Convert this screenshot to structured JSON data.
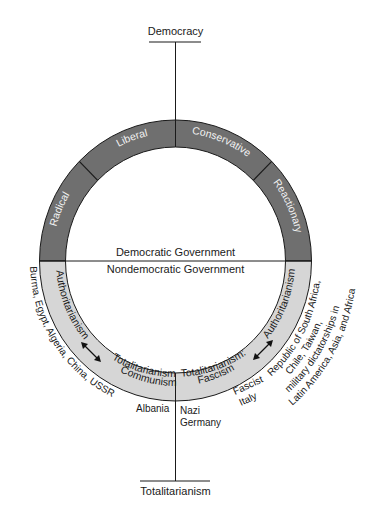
{
  "diagram": {
    "top_pole": "Democracy",
    "bottom_pole": "Totalitarianism",
    "divider": {
      "upper": "Democratic Government",
      "lower": "Nondemocratic Government"
    },
    "upper_ring": {
      "color": "#6f6f6f",
      "segments": [
        "Radical",
        "Liberal",
        "Conservative",
        "Reactionary"
      ]
    },
    "lower_ring": {
      "color": "#d6d6d6",
      "left": {
        "authoritarianism": "Authoritarianism",
        "totalitarianism_line1": "Totalitarianism:",
        "totalitarianism_line2": "Communism",
        "examples": "Burma, Egypt, Algeria, China, USSR",
        "example_extra": "Albania"
      },
      "right": {
        "authoritarianism": "Authoritarianism",
        "totalitarianism_line1": "Totalitarianism:",
        "totalitarianism_line2": "Fascism",
        "examples_line1": "Republic of South Africa,",
        "examples_line2": "Chile, Taiwan,",
        "examples_line3": "military dictatorships in",
        "examples_line4": "Latin America, Asia, and Africa",
        "fascist_italy_line1": "Fascist",
        "fascist_italy_line2": "Italy",
        "nazi_line1": "Nazi",
        "nazi_line2": "Germany"
      }
    }
  }
}
